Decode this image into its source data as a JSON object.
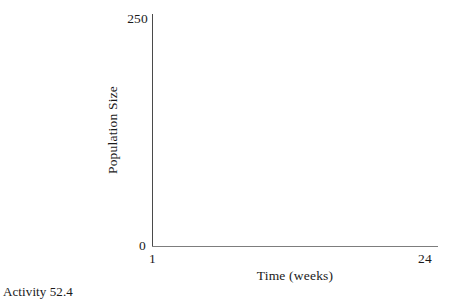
{
  "caption": "Activity 52.4",
  "chart_data": {
    "type": "line",
    "title": "",
    "xlabel": "Time (weeks)",
    "ylabel": "Population Size",
    "xlim": [
      1,
      24
    ],
    "ylim": [
      0,
      250
    ],
    "x_tick_labels": [
      "1",
      "24"
    ],
    "y_tick_labels": [
      "0",
      "250"
    ],
    "grid": false,
    "legend": null,
    "series": [],
    "x": [],
    "values": [],
    "note": "Blank graph template — axes drawn with no plotted data"
  },
  "axes": {
    "y_max_label": "250",
    "y_min_label": "0",
    "x_min_label": "1",
    "x_max_label": "24",
    "y_title": "Population Size",
    "x_title": "Time (weeks)"
  },
  "colors": {
    "background": "#ffffff",
    "ink": "#1a1a1a",
    "axis_y": "#4a4a4a",
    "axis_x": "#7d7d7d"
  }
}
